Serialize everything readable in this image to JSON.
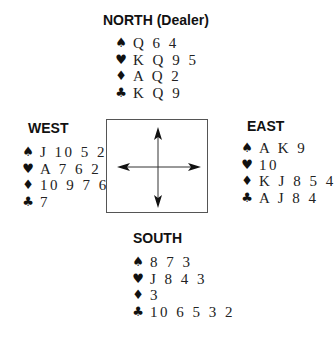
{
  "hands": {
    "north": {
      "label": "NORTH (Dealer)",
      "spades": "Q 6 4",
      "hearts": "K Q 9 5",
      "diamonds": "A Q 2",
      "clubs": "K Q 9"
    },
    "west": {
      "label": "WEST",
      "spades": "J 10 5 2",
      "hearts": "A 7 6 2",
      "diamonds": "10 9 7 6",
      "clubs": "7"
    },
    "east": {
      "label": "EAST",
      "spades": "A K 9",
      "hearts": "10",
      "diamonds": "K J 8 5 4",
      "clubs": "A J 8 4"
    },
    "south": {
      "label": "SOUTH",
      "spades": "8 7 3",
      "hearts": "J 8 4 3",
      "diamonds": "3",
      "clubs": "10 6 5 3 2"
    }
  },
  "suit_symbols": {
    "spades": "♠",
    "hearts": "♥",
    "diamonds": "♦",
    "clubs": "♣"
  },
  "colors": {
    "text": "#111111",
    "box_border": "#555555",
    "background": "#ffffff"
  }
}
